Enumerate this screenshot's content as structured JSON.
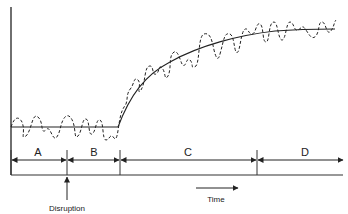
{
  "diagram": {
    "title": "",
    "intervals": [
      {
        "label": "A",
        "x_start": 11,
        "x_end": 67
      },
      {
        "label": "B",
        "x_start": 67,
        "x_end": 120
      },
      {
        "label": "C",
        "x_start": 120,
        "x_end": 257
      },
      {
        "label": "D",
        "x_start": 257,
        "x_end": 343
      }
    ],
    "event_marker": {
      "label": "Disruption",
      "x": 67
    },
    "time_axis": {
      "label": "Time"
    },
    "series": [
      {
        "name": "trend",
        "style": "solid"
      },
      {
        "name": "fluctuation",
        "style": "dashed"
      }
    ],
    "colors": {
      "line": "#222222",
      "background": "#ffffff"
    }
  }
}
